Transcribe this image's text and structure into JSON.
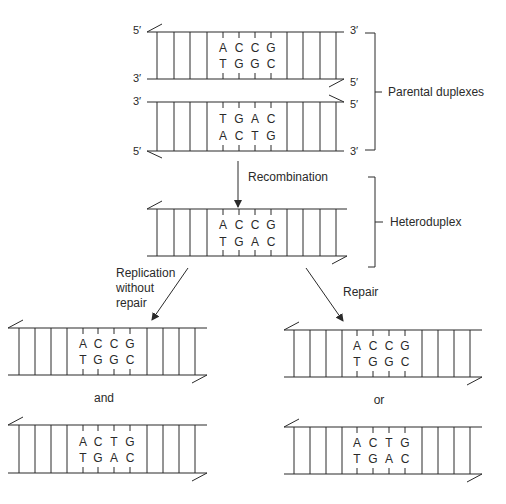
{
  "figure": {
    "labels": {
      "parental": "Parental duplexes",
      "heteroduplex": "Heteroduplex",
      "recombination": "Recombination",
      "replication_line1": "Replication",
      "replication_line2": "without",
      "replication_line3": "repair",
      "repair": "Repair",
      "and": "and",
      "or": "or"
    },
    "ends": {
      "five_prime": "5′",
      "three_prime": "3′"
    },
    "duplexes": {
      "parental_1": {
        "top": [
          "A",
          "C",
          "C",
          "G"
        ],
        "bottom": [
          "T",
          "G",
          "G",
          "C"
        ]
      },
      "parental_2": {
        "top": [
          "T",
          "G",
          "A",
          "C"
        ],
        "bottom": [
          "A",
          "C",
          "T",
          "G"
        ]
      },
      "heteroduplex": {
        "top": [
          "A",
          "C",
          "C",
          "G"
        ],
        "bottom": [
          "T",
          "G",
          "A",
          "C"
        ]
      },
      "no_repair_1": {
        "top": [
          "A",
          "C",
          "C",
          "G"
        ],
        "bottom": [
          "T",
          "G",
          "G",
          "C"
        ]
      },
      "no_repair_2": {
        "top": [
          "A",
          "C",
          "T",
          "G"
        ],
        "bottom": [
          "T",
          "G",
          "A",
          "C"
        ]
      },
      "repair_1": {
        "top": [
          "A",
          "C",
          "C",
          "G"
        ],
        "bottom": [
          "T",
          "G",
          "G",
          "C"
        ]
      },
      "repair_2": {
        "top": [
          "A",
          "C",
          "T",
          "G"
        ],
        "bottom": [
          "T",
          "G",
          "A",
          "C"
        ]
      }
    },
    "colors": {
      "ink": "#2a2a2a",
      "background": "#ffffff"
    }
  }
}
